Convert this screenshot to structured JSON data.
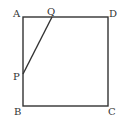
{
  "diagram": {
    "type": "geometry-square",
    "stroke_color": "#333333",
    "points": {
      "A": {
        "label": "A",
        "x": 23,
        "y": 17
      },
      "B": {
        "label": "B",
        "x": 23,
        "y": 106
      },
      "C": {
        "label": "C",
        "x": 108,
        "y": 106
      },
      "D": {
        "label": "D",
        "x": 108,
        "y": 17
      },
      "P": {
        "label": "P",
        "x": 23,
        "y": 74
      },
      "Q": {
        "label": "Q",
        "x": 52,
        "y": 17
      }
    },
    "segments": [
      [
        "A",
        "D"
      ],
      [
        "D",
        "C"
      ],
      [
        "C",
        "B"
      ],
      [
        "B",
        "A"
      ],
      [
        "P",
        "Q"
      ]
    ]
  }
}
